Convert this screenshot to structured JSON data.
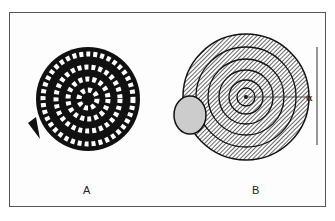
{
  "figure": {
    "panels": [
      {
        "label": "A",
        "subject": "coiled ammonite-like shell with ribbed whorls"
      },
      {
        "label": "B",
        "subject": "planispiral gastropod-like shell with aperture and angle marker"
      }
    ],
    "angle_symbol": "α"
  }
}
